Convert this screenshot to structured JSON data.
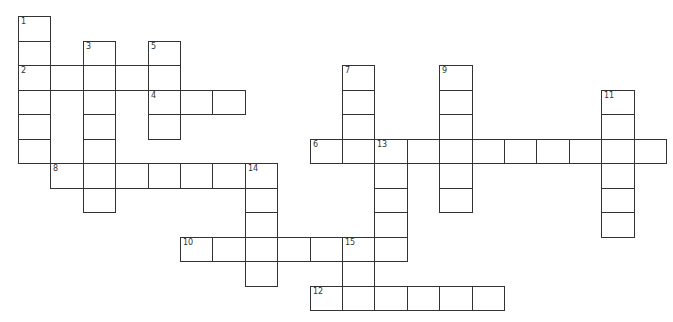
{
  "puzzle": {
    "type": "crossword",
    "grid": {
      "origin_x": 18,
      "origin_y": 16,
      "cell_w": 32.4,
      "cell_h": 24.5,
      "border_color": "#333333"
    },
    "words": [
      {
        "number": "1",
        "dir": "down",
        "row": 0,
        "col": 0,
        "length": 6
      },
      {
        "number": "2",
        "dir": "across",
        "row": 2,
        "col": 0,
        "length": 5
      },
      {
        "number": "3",
        "dir": "down",
        "row": 1,
        "col": 2,
        "length": 7
      },
      {
        "number": "4",
        "dir": "across",
        "row": 3,
        "col": 4,
        "length": 3
      },
      {
        "number": "5",
        "dir": "down",
        "row": 1,
        "col": 4,
        "length": 4
      },
      {
        "number": "6",
        "dir": "across",
        "row": 5,
        "col": 9,
        "length": 11
      },
      {
        "number": "7",
        "dir": "down",
        "row": 2,
        "col": 10,
        "length": 4
      },
      {
        "number": "8",
        "dir": "across",
        "row": 6,
        "col": 1,
        "length": 7
      },
      {
        "number": "9",
        "dir": "down",
        "row": 2,
        "col": 13,
        "length": 6
      },
      {
        "number": "10",
        "dir": "across",
        "row": 9,
        "col": 5,
        "length": 7
      },
      {
        "number": "11",
        "dir": "down",
        "row": 3,
        "col": 18,
        "length": 6
      },
      {
        "number": "12",
        "dir": "across",
        "row": 11,
        "col": 9,
        "length": 6
      },
      {
        "number": "13",
        "dir": "down",
        "row": 5,
        "col": 11,
        "length": 5
      },
      {
        "number": "14",
        "dir": "down",
        "row": 6,
        "col": 7,
        "length": 5
      },
      {
        "number": "15",
        "dir": "down",
        "row": 9,
        "col": 10,
        "length": 3
      }
    ]
  }
}
